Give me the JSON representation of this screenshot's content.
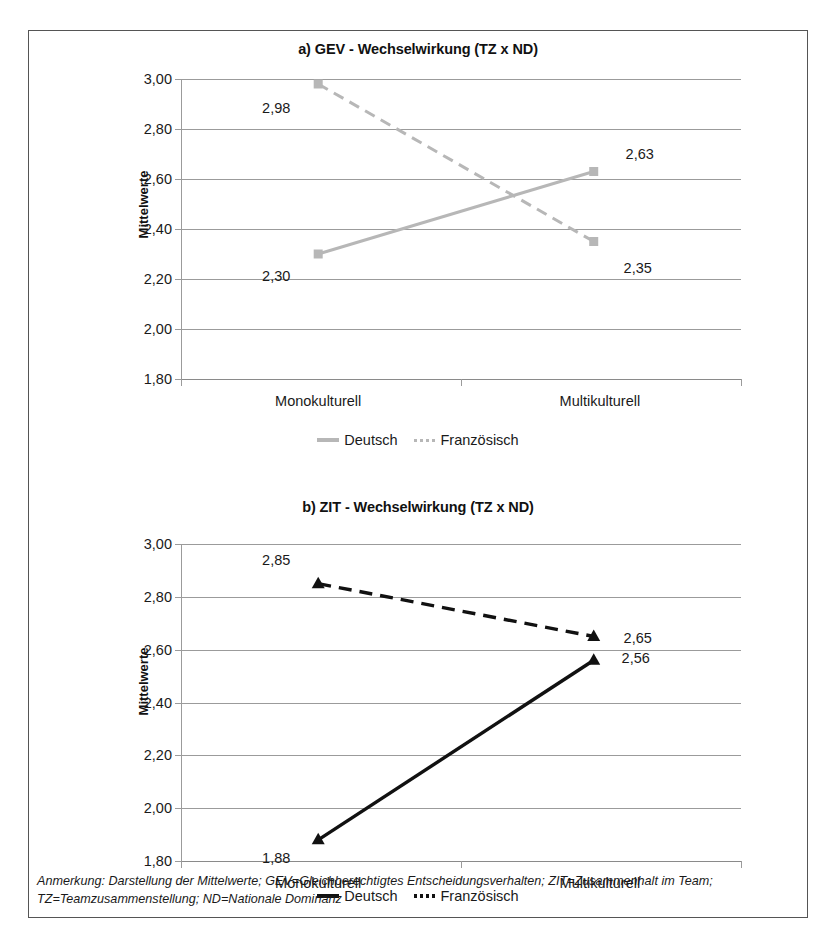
{
  "figure": {
    "footnote": "Anmerkung: Darstellung der Mittelwerte; GEV=Gleichberechtigtes Entscheidungsverhalten; ZIT=Zusammenhalt im Team; TZ=Teamzusammenstellung; ND=Nationale Dominanz"
  },
  "colors": {
    "grey_series": "#b7b7b7",
    "black_series": "#111111",
    "gridline": "#9b9b9b",
    "frame": "#555555",
    "text": "#1a1a1a"
  },
  "chart_data": [
    {
      "id": "panel-a",
      "type": "line",
      "title": "a) GEV - Wechselwirkung (TZ x ND)",
      "xlabel": "",
      "ylabel": "Mittelwerte",
      "categories": [
        "Monokulturell",
        "Multikulturell"
      ],
      "ylim": [
        1.8,
        3.0
      ],
      "yticks": [
        "1,80",
        "2,00",
        "2,20",
        "2,40",
        "2,60",
        "2,80",
        "3,00"
      ],
      "ytick_values": [
        1.8,
        2.0,
        2.2,
        2.4,
        2.6,
        2.8,
        3.0
      ],
      "grid": true,
      "legend_position": "bottom",
      "series": [
        {
          "name": "Deutsch",
          "style": "solid",
          "color": "#b7b7b7",
          "marker": "square",
          "values": [
            2.3,
            2.63
          ],
          "labels": [
            "2,30",
            "2,63"
          ]
        },
        {
          "name": "Französisch",
          "style": "dashed",
          "color": "#b7b7b7",
          "marker": "square",
          "values": [
            2.98,
            2.35
          ],
          "labels": [
            "2,98",
            "2,35"
          ]
        }
      ]
    },
    {
      "id": "panel-b",
      "type": "line",
      "title": "b) ZIT - Wechselwirkung (TZ x ND)",
      "xlabel": "",
      "ylabel": "Mittelwerte",
      "categories": [
        "Monokulturell",
        "Multikulturell"
      ],
      "ylim": [
        1.8,
        3.0
      ],
      "yticks": [
        "1,80",
        "2,00",
        "2,20",
        "2,40",
        "2,60",
        "2,80",
        "3,00"
      ],
      "ytick_values": [
        1.8,
        2.0,
        2.2,
        2.4,
        2.6,
        2.8,
        3.0
      ],
      "grid": true,
      "legend_position": "bottom",
      "series": [
        {
          "name": "Deutsch",
          "style": "solid",
          "color": "#111111",
          "marker": "triangle",
          "values": [
            1.88,
            2.56
          ],
          "labels": [
            "1,88",
            "2,56"
          ]
        },
        {
          "name": "Französisch",
          "style": "dashed",
          "color": "#111111",
          "marker": "triangle",
          "values": [
            2.85,
            2.65
          ],
          "labels": [
            "2,85",
            "2,65"
          ]
        }
      ]
    }
  ]
}
